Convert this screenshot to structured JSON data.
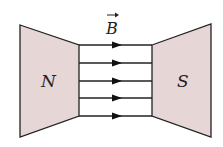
{
  "diagram": {
    "field_label": "B",
    "north_label": "N",
    "south_label": "S",
    "pole_fill": "#e6d6d6",
    "line_color": "#222222",
    "field_lines": [
      45,
      63,
      81,
      98,
      116
    ],
    "field_direction": "left-to-right"
  }
}
